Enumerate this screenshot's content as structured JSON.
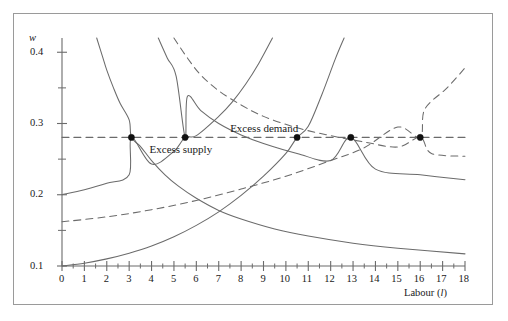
{
  "figure": {
    "name": "labour-market-equilibrium-diagram",
    "background": "#ffffff",
    "frame_color": "#9a9a9a",
    "line_color": "#6b6b6b",
    "dot_color": "#111111",
    "text_color": "#1a1a1a"
  },
  "axes": {
    "y_label": "w",
    "y_ticks_major": [
      "0.1",
      "0.2",
      "0.3",
      "0.4"
    ],
    "y_major_values": [
      0.1,
      0.2,
      0.3,
      0.4
    ],
    "y_minor_values": [
      0.15,
      0.25,
      0.35
    ],
    "y_min": 0.1,
    "y_max": 0.42,
    "x_label": "Labour (",
    "x_label_italic": "l",
    "x_label_close": ")",
    "x_ticks_major": [
      "0",
      "1",
      "2",
      "3",
      "4",
      "5",
      "6",
      "7",
      "8",
      "9",
      "10",
      "11",
      "12",
      "13",
      "14",
      "15",
      "16",
      "17",
      "18"
    ],
    "x_min": 0,
    "x_max": 18
  },
  "annotations": {
    "excess_demand": "Excess demand",
    "excess_supply": "Excess supply"
  },
  "chart_data": {
    "type": "line",
    "title": "",
    "xlabel": "Labour (l)",
    "ylabel": "w",
    "xlim": [
      0,
      18
    ],
    "ylim": [
      0.1,
      0.42
    ],
    "grid": false,
    "legend": null,
    "annotations": [
      {
        "text": "Excess demand",
        "x": 7.6,
        "y": 0.292
      },
      {
        "text": "Excess supply",
        "x": 4.0,
        "y": 0.267
      }
    ],
    "series": [
      {
        "name": "labour demand (solid, low)",
        "style": "solid",
        "points": [
          [
            1.55,
            0.42
          ],
          [
            1.8,
            0.395
          ],
          [
            2.0,
            0.375
          ],
          [
            2.3,
            0.35
          ],
          [
            2.6,
            0.328
          ],
          [
            3.0,
            0.305
          ],
          [
            3.1,
            0.2805
          ],
          [
            3.5,
            0.268
          ],
          [
            4.0,
            0.248
          ],
          [
            4.6,
            0.228
          ],
          [
            5.2,
            0.212
          ],
          [
            6.0,
            0.195
          ],
          [
            7.0,
            0.178
          ],
          [
            8.0,
            0.166
          ],
          [
            9.5,
            0.152
          ],
          [
            11.0,
            0.142
          ],
          [
            13.0,
            0.132
          ],
          [
            15.0,
            0.125
          ],
          [
            18.0,
            0.117
          ]
        ]
      },
      {
        "name": "labour demand (solid, high)",
        "style": "solid",
        "points": [
          [
            4.3,
            0.42
          ],
          [
            4.7,
            0.392
          ],
          [
            5.1,
            0.366
          ],
          [
            5.5,
            0.2805
          ],
          [
            5.6,
            0.338
          ],
          [
            6.2,
            0.318
          ],
          [
            7.0,
            0.3
          ],
          [
            8.0,
            0.284
          ],
          [
            9.0,
            0.272
          ],
          [
            10.5,
            0.2805
          ],
          [
            10.5,
            0.258
          ],
          [
            12.0,
            0.248
          ],
          [
            12.9,
            0.2805
          ],
          [
            14.0,
            0.236
          ],
          [
            16.0,
            0.228
          ],
          [
            18.0,
            0.221
          ]
        ]
      },
      {
        "name": "labour supply (solid, low)",
        "style": "solid",
        "points": [
          [
            0.0,
            0.1
          ],
          [
            1.0,
            0.104
          ],
          [
            2.0,
            0.11
          ],
          [
            3.0,
            0.118
          ],
          [
            4.0,
            0.128
          ],
          [
            5.0,
            0.141
          ],
          [
            6.0,
            0.157
          ],
          [
            7.0,
            0.176
          ],
          [
            8.0,
            0.199
          ],
          [
            9.0,
            0.226
          ],
          [
            10.0,
            0.258
          ],
          [
            10.5,
            0.2805
          ],
          [
            11.0,
            0.296
          ],
          [
            11.6,
            0.34
          ],
          [
            12.2,
            0.39
          ],
          [
            12.6,
            0.42
          ]
        ]
      },
      {
        "name": "labour supply (solid, high)",
        "style": "solid",
        "points": [
          [
            0.0,
            0.2
          ],
          [
            1.0,
            0.207
          ],
          [
            2.0,
            0.216
          ],
          [
            3.0,
            0.228
          ],
          [
            3.1,
            0.2805
          ],
          [
            4.0,
            0.243
          ],
          [
            5.0,
            0.261
          ],
          [
            5.5,
            0.2805
          ],
          [
            6.0,
            0.283
          ],
          [
            7.0,
            0.31
          ],
          [
            7.6,
            0.33
          ],
          [
            8.2,
            0.355
          ],
          [
            8.8,
            0.385
          ],
          [
            9.4,
            0.42
          ]
        ]
      },
      {
        "name": "labour demand (dashed)",
        "style": "dashed",
        "points": [
          [
            5.0,
            0.42
          ],
          [
            5.6,
            0.392
          ],
          [
            6.2,
            0.368
          ],
          [
            7.0,
            0.346
          ],
          [
            8.0,
            0.326
          ],
          [
            9.0,
            0.31
          ],
          [
            10.5,
            0.294
          ],
          [
            12.0,
            0.283
          ],
          [
            13.5,
            0.274
          ],
          [
            15.0,
            0.267
          ],
          [
            16.0,
            0.2805
          ],
          [
            16.5,
            0.258
          ],
          [
            18.0,
            0.254
          ]
        ]
      },
      {
        "name": "labour supply (dashed)",
        "style": "dashed",
        "points": [
          [
            0.0,
            0.162
          ],
          [
            2.0,
            0.169
          ],
          [
            4.0,
            0.179
          ],
          [
            6.0,
            0.192
          ],
          [
            8.0,
            0.208
          ],
          [
            10.0,
            0.226
          ],
          [
            12.0,
            0.248
          ],
          [
            13.5,
            0.266
          ],
          [
            16.0,
            0.2805
          ],
          [
            15.0,
            0.295
          ],
          [
            16.2,
            0.32
          ],
          [
            17.2,
            0.35
          ],
          [
            18.0,
            0.378
          ]
        ]
      },
      {
        "name": "wage level (horizontal dashed)",
        "style": "dashed",
        "points": [
          [
            0.0,
            0.2805
          ],
          [
            18.0,
            0.2805
          ]
        ]
      }
    ],
    "marked_points": [
      {
        "x": 3.1,
        "y": 0.2805,
        "label": ""
      },
      {
        "x": 5.5,
        "y": 0.2805,
        "label": ""
      },
      {
        "x": 10.5,
        "y": 0.2805,
        "label": ""
      },
      {
        "x": 12.9,
        "y": 0.2805,
        "label": ""
      },
      {
        "x": 16.0,
        "y": 0.2805,
        "label": ""
      }
    ]
  }
}
